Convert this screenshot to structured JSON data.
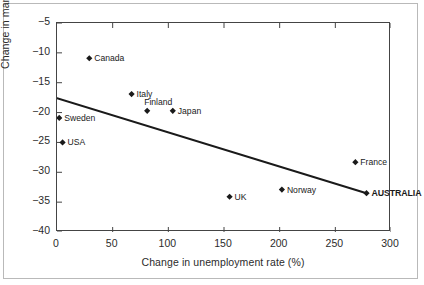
{
  "chart_data": {
    "type": "scatter",
    "title": "",
    "xlabel": "Change in unemployment rate (%)",
    "ylabel": "Change in manuf. share (%)",
    "xlim": [
      0,
      300
    ],
    "ylim": [
      -40,
      -5
    ],
    "xticks": [
      "0",
      "50",
      "100",
      "150",
      "200",
      "250",
      "300"
    ],
    "xtick_values": [
      0,
      50,
      100,
      150,
      200,
      250,
      300
    ],
    "yticks": [
      "-5",
      "-10",
      "-15",
      "-20",
      "-25",
      "-30",
      "-35",
      "-40"
    ],
    "ytick_values": [
      -5,
      -10,
      -15,
      -20,
      -25,
      -30,
      -35,
      -40
    ],
    "grid": false,
    "legend": "none",
    "marker": "diamond",
    "points": [
      {
        "label": "Canada",
        "x": 29,
        "y": -10.9,
        "label_pos": "right",
        "bold": false
      },
      {
        "label": "Italy",
        "x": 67,
        "y": -16.9,
        "label_pos": "right",
        "bold": false
      },
      {
        "label": "Finland",
        "x": 81,
        "y": -19.7,
        "label_pos": "above",
        "bold": false
      },
      {
        "label": "Japan",
        "x": 104,
        "y": -19.7,
        "label_pos": "right",
        "bold": false
      },
      {
        "label": "Sweden",
        "x": 2,
        "y": -20.9,
        "label_pos": "right",
        "bold": false
      },
      {
        "label": "USA",
        "x": 5,
        "y": -25.0,
        "label_pos": "right",
        "bold": false
      },
      {
        "label": "UK",
        "x": 155,
        "y": -34.1,
        "label_pos": "right",
        "bold": false
      },
      {
        "label": "Norway",
        "x": 202,
        "y": -32.9,
        "label_pos": "right",
        "bold": false
      },
      {
        "label": "France",
        "x": 268,
        "y": -28.3,
        "label_pos": "right",
        "bold": false
      },
      {
        "label": "AUSTRALIA",
        "x": 278,
        "y": -33.5,
        "label_pos": "right",
        "bold": true
      }
    ],
    "trendline": {
      "type": "line",
      "x_start": 0,
      "y_start": -17.6,
      "x_end": 278,
      "y_end": -33.5
    },
    "colors": {
      "marker": "#1a1a1a",
      "trendline": "#1a1a1a",
      "axis": "#444444",
      "text": "#2b2b2b",
      "background": "#ffffff",
      "frame": "#b9b9b9"
    }
  }
}
